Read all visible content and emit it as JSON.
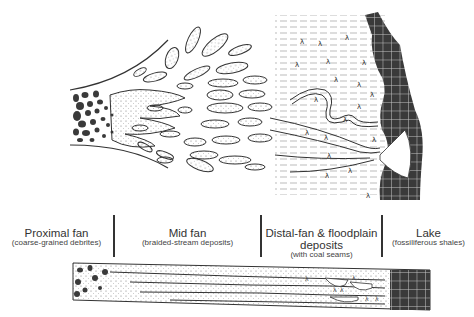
{
  "figure": {
    "type": "alluvial fan to lake depositional model",
    "views": [
      "plan-view",
      "cross-section"
    ]
  },
  "zones": [
    {
      "id": "proximal",
      "title": "Proximal fan",
      "subtitle": "(coarse-grained debrites)"
    },
    {
      "id": "mid",
      "title": "Mid fan",
      "subtitle": "(braided-stream deposits)"
    },
    {
      "id": "distal",
      "title": "Distal-fan & floodplain",
      "title2": "deposits",
      "subtitle": "(with coal seams)"
    },
    {
      "id": "lake",
      "title": "Lake",
      "subtitle": "(fossiliferous shales)"
    }
  ],
  "colors": {
    "line": "#333333",
    "lake_fill": "#3a3a3a",
    "grid": "#bbbbbb",
    "stipple": "#777777",
    "background": "#ffffff"
  },
  "symbols": {
    "plant": "λ"
  }
}
